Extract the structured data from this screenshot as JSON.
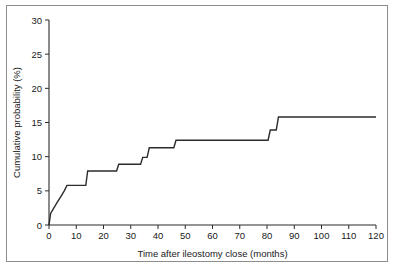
{
  "figure": {
    "frame_color": "#8d8d8d",
    "background_color": "#ffffff",
    "line_color": "#2b2b2b"
  },
  "chart_data": {
    "type": "line",
    "subtype": "step",
    "title": "",
    "xlabel": "Time after ileostomy close (months)",
    "ylabel": "Cumulative probability (%)",
    "xlim": [
      0,
      120
    ],
    "ylim": [
      0,
      30
    ],
    "xticks": [
      0,
      10,
      20,
      30,
      40,
      50,
      60,
      70,
      80,
      90,
      100,
      110,
      120
    ],
    "yticks": [
      0,
      5,
      10,
      15,
      20,
      25,
      30
    ],
    "xtick_labels": [
      "0",
      "10",
      "20",
      "30",
      "40",
      "50",
      "60",
      "70",
      "80",
      "90",
      "100",
      "110",
      "120"
    ],
    "ytick_labels": [
      "0",
      "5",
      "10",
      "15",
      "20",
      "25",
      "30"
    ],
    "grid": false,
    "legend": null,
    "x": [
      0,
      0.6,
      1.8,
      3.0,
      4.4,
      5.6,
      6.6,
      13.5,
      14.2,
      24.8,
      25.6,
      33.6,
      34.4,
      36.0,
      36.8,
      45.8,
      46.6,
      80.4,
      81.2,
      83.4,
      84.2,
      120
    ],
    "y": [
      0,
      1.7,
      2.5,
      3.3,
      4.2,
      5.0,
      5.8,
      5.8,
      7.9,
      7.9,
      8.9,
      8.9,
      9.9,
      9.9,
      11.3,
      11.3,
      12.4,
      12.4,
      13.9,
      13.9,
      15.8,
      15.8
    ],
    "steps": [
      {
        "time": 0.0,
        "probability": 0.0
      },
      {
        "time": 0.6,
        "probability": 1.7
      },
      {
        "time": 1.8,
        "probability": 2.5
      },
      {
        "time": 3.0,
        "probability": 3.3
      },
      {
        "time": 4.4,
        "probability": 4.2
      },
      {
        "time": 5.6,
        "probability": 5.0
      },
      {
        "time": 6.6,
        "probability": 5.8
      },
      {
        "time": 14.2,
        "probability": 7.9
      },
      {
        "time": 25.6,
        "probability": 8.9
      },
      {
        "time": 34.4,
        "probability": 9.9
      },
      {
        "time": 36.8,
        "probability": 11.3
      },
      {
        "time": 46.6,
        "probability": 12.4
      },
      {
        "time": 81.2,
        "probability": 13.9
      },
      {
        "time": 84.2,
        "probability": 15.8
      },
      {
        "time": 120.0,
        "probability": 15.8
      }
    ],
    "final_value": 15.8
  }
}
